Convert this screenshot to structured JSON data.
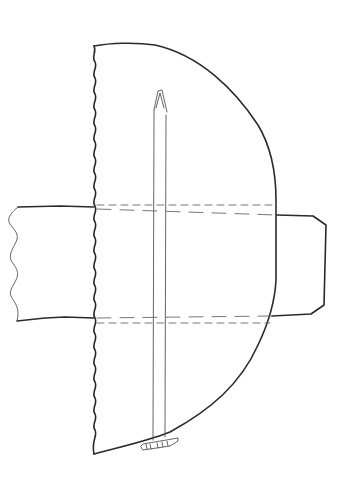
{
  "diagram": {
    "type": "line-drawing",
    "style": "hand-drawn technical sketch",
    "background_color": "#ffffff",
    "ink_color": "#2a2a2a",
    "elements": [
      {
        "name": "main-body",
        "description": "D-shaped body with wavy (torn) left edge and rounded right edge"
      },
      {
        "name": "horizontal-band",
        "description": "Horizontal band passing through the body, wavy left end, squared right end"
      },
      {
        "name": "hidden-lines",
        "description": "Dashed lines showing the band's edges hidden behind the body"
      },
      {
        "name": "vertical-rod",
        "description": "Long thin rod with pointed tip at top"
      },
      {
        "name": "foot-plate",
        "description": "Small plate attached at the bottom of the rod"
      }
    ],
    "labels": []
  }
}
